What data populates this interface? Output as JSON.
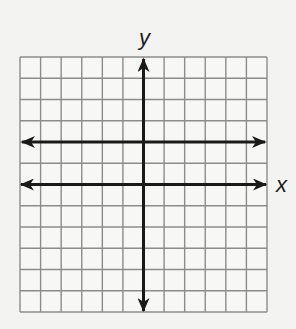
{
  "chart_data": {
    "type": "line",
    "title": "",
    "xlabel": "x",
    "ylabel": "y",
    "xlim": [
      -6,
      6
    ],
    "ylim": [
      -6,
      6
    ],
    "grid": true,
    "grid_step": 1,
    "axes_arrows": true,
    "legend": null,
    "series": [
      {
        "name": "horizontal line",
        "equation": "y = 2",
        "x": [
          -6,
          6
        ],
        "values": [
          2,
          2
        ],
        "arrows_both_ends": true
      }
    ]
  },
  "colors": {
    "background": "#f3f3f1",
    "grid": "#8c8c8c",
    "axes": "#1a1a1a",
    "line": "#1a1a1a"
  },
  "labels": {
    "x_axis": "x",
    "y_axis": "y"
  }
}
